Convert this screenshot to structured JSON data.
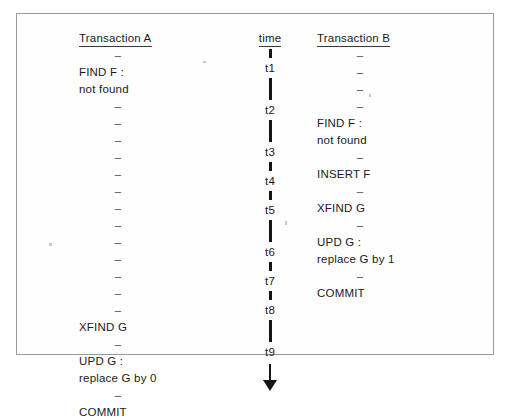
{
  "figure": {
    "frame_color": "#9a9a9a",
    "ink_color": "#1a1a1a"
  },
  "columns": {
    "transaction_a": {
      "header": "Transaction A",
      "rows": [
        {
          "type": "dash",
          "text": "–"
        },
        {
          "type": "text",
          "text": "FIND F :"
        },
        {
          "type": "text",
          "text": "not found"
        },
        {
          "type": "dash",
          "text": "–"
        },
        {
          "type": "dash",
          "text": "–"
        },
        {
          "type": "dash",
          "text": "–"
        },
        {
          "type": "dash",
          "text": "–"
        },
        {
          "type": "dash",
          "text": "–"
        },
        {
          "type": "dash",
          "text": "–"
        },
        {
          "type": "dash",
          "text": "–"
        },
        {
          "type": "dash",
          "text": "–"
        },
        {
          "type": "dash",
          "text": "–"
        },
        {
          "type": "dash",
          "text": "–"
        },
        {
          "type": "dash",
          "text": "–"
        },
        {
          "type": "dash",
          "text": "–"
        },
        {
          "type": "dash",
          "text": "–"
        },
        {
          "type": "text",
          "text": "XFIND G"
        },
        {
          "type": "dash",
          "text": "–"
        },
        {
          "type": "text",
          "text": "UPD G :"
        },
        {
          "type": "text",
          "text": "replace G by 0"
        },
        {
          "type": "dash",
          "text": "–"
        },
        {
          "type": "text",
          "text": "COMMIT"
        }
      ]
    },
    "transaction_b": {
      "header": "Transaction B",
      "rows": [
        {
          "type": "dash",
          "text": "–"
        },
        {
          "type": "dash",
          "text": "–"
        },
        {
          "type": "dash",
          "text": "–"
        },
        {
          "type": "dash",
          "text": "–"
        },
        {
          "type": "text",
          "text": "FIND F :"
        },
        {
          "type": "text",
          "text": "not found"
        },
        {
          "type": "dash",
          "text": "–"
        },
        {
          "type": "text",
          "text": "INSERT F"
        },
        {
          "type": "dash",
          "text": "–"
        },
        {
          "type": "text",
          "text": "XFIND G"
        },
        {
          "type": "dash",
          "text": "–"
        },
        {
          "type": "text",
          "text": "UPD G :"
        },
        {
          "type": "text",
          "text": "replace G by 1"
        },
        {
          "type": "dash",
          "text": "–"
        },
        {
          "type": "text",
          "text": "COMMIT"
        }
      ]
    },
    "time": {
      "header": "time",
      "ticks": [
        "t1",
        "t2",
        "t3",
        "t4",
        "t5",
        "t6",
        "t7",
        "t8",
        "t9"
      ],
      "arrow_direction": "down"
    }
  }
}
